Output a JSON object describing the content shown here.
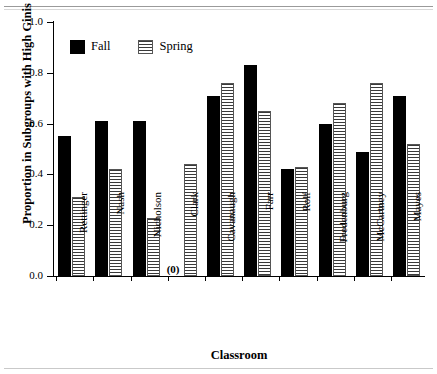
{
  "chart_data": {
    "type": "bar",
    "title": "",
    "xlabel": "Classroom",
    "ylabel": "Proportion in Subgroups with High Ginis",
    "ylim": [
      0.0,
      1.0
    ],
    "ytick_labels": [
      "0.0",
      "0.2",
      "0.4",
      "0.6",
      "0.8",
      "1.0"
    ],
    "ytick_values": [
      0.0,
      0.2,
      0.4,
      0.6,
      0.8,
      1.0
    ],
    "grid": false,
    "legend_position": "top-left",
    "categories": [
      "Rettinger",
      "Nash",
      "Nicholson",
      "Clark",
      "Cavanaugh",
      "Farr",
      "Rolf",
      "Fredenburg",
      "McCartney",
      "Mayes"
    ],
    "series": [
      {
        "name": "Fall",
        "color": "#000000",
        "fill": "solid",
        "values": [
          0.55,
          0.61,
          0.61,
          0.0,
          0.71,
          0.83,
          0.42,
          0.6,
          0.49,
          0.71
        ]
      },
      {
        "name": "Spring",
        "color": "#3a3a3a",
        "fill": "horizontal-stripes",
        "values": [
          0.31,
          0.42,
          0.23,
          0.44,
          0.76,
          0.65,
          0.43,
          0.68,
          0.76,
          0.52
        ]
      }
    ],
    "annotations": [
      {
        "text": "(0)",
        "category": "Clark",
        "series": "Fall",
        "value": 0.0
      }
    ]
  },
  "legend": {
    "items": [
      {
        "label": "Fall",
        "swatch": "solid-black-square"
      },
      {
        "label": "Spring",
        "swatch": "striped-square"
      }
    ]
  }
}
